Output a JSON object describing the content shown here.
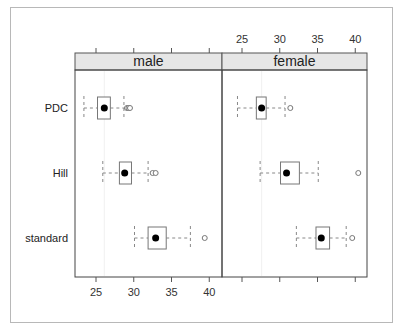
{
  "chart_data": {
    "type": "boxplot",
    "title": "",
    "xlabel": "",
    "ylabel": "",
    "xlim": [
      22.3,
      41.7
    ],
    "x_ticks": [
      25,
      30,
      35,
      40
    ],
    "categories": [
      "PDC",
      "Hill",
      "standard"
    ],
    "panels": [
      {
        "name": "male",
        "boxes": [
          {
            "category": "PDC",
            "whisker_low": 23.4,
            "q1": 25.2,
            "median": 26.1,
            "q3": 26.9,
            "whisker_high": 28.7,
            "outliers": [
              29.1,
              29.3,
              29.5
            ]
          },
          {
            "category": "Hill",
            "whisker_low": 25.9,
            "q1": 28.1,
            "median": 28.8,
            "q3": 29.7,
            "whisker_high": 31.9,
            "outliers": [
              32.5,
              32.9
            ]
          },
          {
            "category": "standard",
            "whisker_low": 30.1,
            "q1": 31.9,
            "median": 32.9,
            "q3": 34.3,
            "whisker_high": 37.5,
            "outliers": [
              39.4
            ]
          }
        ]
      },
      {
        "name": "female",
        "boxes": [
          {
            "category": "PDC",
            "whisker_low": 24.4,
            "q1": 26.9,
            "median": 27.6,
            "q3": 28.2,
            "whisker_high": 30.7,
            "outliers": [
              31.4
            ]
          },
          {
            "category": "Hill",
            "whisker_low": 27.4,
            "q1": 30.1,
            "median": 30.9,
            "q3": 32.6,
            "whisker_high": 35.1,
            "outliers": [
              40.4
            ]
          },
          {
            "category": "standard",
            "whisker_low": 32.2,
            "q1": 34.8,
            "median": 35.5,
            "q3": 36.6,
            "whisker_high": 38.8,
            "outliers": [
              39.6
            ]
          }
        ]
      }
    ],
    "axis_positions": {
      "male": "bottom",
      "female": "top"
    },
    "grid": false,
    "legend": null
  }
}
